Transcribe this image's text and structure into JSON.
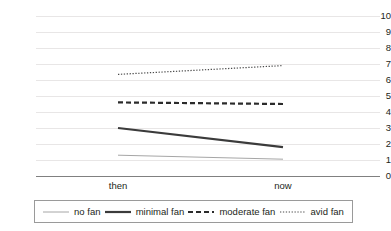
{
  "chart_data": {
    "type": "line",
    "title": "",
    "xlabel": "",
    "ylabel": "",
    "categories": [
      "then",
      "now"
    ],
    "x_tick_labels": [
      "then",
      "now"
    ],
    "y_tick_labels": [
      "0",
      "1",
      "2",
      "3",
      "4",
      "5",
      "6",
      "7",
      "8",
      "9",
      "10"
    ],
    "ylim": [
      0,
      10
    ],
    "y_tick_step": 1,
    "grid": true,
    "grid_axis": "y",
    "legend_position": "bottom",
    "series": [
      {
        "name": "no fan",
        "values": [
          1.3,
          1.05
        ],
        "line_style": "solid",
        "line_width": 1,
        "color": "#a6a6a6"
      },
      {
        "name": "minimal fan",
        "values": [
          3.0,
          1.8
        ],
        "line_style": "solid",
        "line_width": 2.2,
        "color": "#3b3b3b"
      },
      {
        "name": "moderate fan",
        "values": [
          4.6,
          4.5
        ],
        "line_style": "dashed",
        "line_width": 2.2,
        "color": "#2b2b2b"
      },
      {
        "name": "avid fan",
        "values": [
          6.35,
          6.9
        ],
        "line_style": "dotted",
        "line_width": 1.2,
        "color": "#4a4a4a"
      }
    ]
  },
  "legend": {
    "items": [
      {
        "label": "no fan"
      },
      {
        "label": "minimal fan"
      },
      {
        "label": "moderate fan"
      },
      {
        "label": "avid fan"
      }
    ]
  },
  "colors": {
    "gridline": "#e8e6e6",
    "axis": "#808080",
    "text": "#231f20",
    "legend_border": "#9a9a9a",
    "background": "#ffffff"
  }
}
